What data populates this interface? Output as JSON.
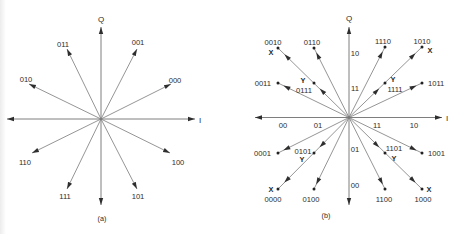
{
  "panel_a": {
    "caption": "(a)",
    "axis_q": "Q",
    "axis_i": "I",
    "symbols": [
      "000",
      "001",
      "011",
      "010",
      "110",
      "111",
      "101",
      "100"
    ]
  },
  "panel_b": {
    "caption": "(b)",
    "axis_q": "Q",
    "axis_i": "I",
    "i_axis_labels": [
      "00",
      "01",
      "11",
      "10"
    ],
    "q_axis_labels": [
      "10",
      "11",
      "01",
      "00"
    ],
    "points": [
      {
        "label": "0010",
        "marker": "X"
      },
      {
        "label": "0110",
        "marker": ""
      },
      {
        "label": "0011",
        "marker": ""
      },
      {
        "label": "0111",
        "marker": "Y"
      },
      {
        "label": "1110",
        "marker": ""
      },
      {
        "label": "1010",
        "marker": "X"
      },
      {
        "label": "1111",
        "marker": "Y"
      },
      {
        "label": "1011",
        "marker": ""
      },
      {
        "label": "0001",
        "marker": ""
      },
      {
        "label": "0101",
        "marker": "Y"
      },
      {
        "label": "0000",
        "marker": "X"
      },
      {
        "label": "0100",
        "marker": ""
      },
      {
        "label": "1101",
        "marker": "Y"
      },
      {
        "label": "1001",
        "marker": ""
      },
      {
        "label": "1100",
        "marker": ""
      },
      {
        "label": "1000",
        "marker": "X"
      }
    ]
  },
  "colors": {
    "background": "#ffffff",
    "lines": "#7a7a7a",
    "text": "#2b2b2b"
  }
}
